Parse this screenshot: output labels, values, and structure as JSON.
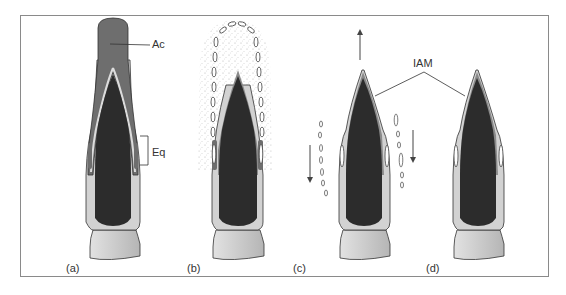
{
  "figure": {
    "panels": [
      {
        "id": "a",
        "label": "(a)"
      },
      {
        "id": "b",
        "label": "(b)"
      },
      {
        "id": "c",
        "label": "(c)"
      },
      {
        "id": "d",
        "label": "(d)"
      }
    ],
    "annotations": {
      "acrosome": "Ac",
      "equatorial": "Eq",
      "inner_acrosomal_membrane": "IAM"
    },
    "colors": {
      "nucleus": "#2a2a2a",
      "acrosome": "#6a6a6a",
      "cytoplasm": "#cfcfcf",
      "outline": "#333333",
      "frame": "#8a8a8a"
    }
  }
}
